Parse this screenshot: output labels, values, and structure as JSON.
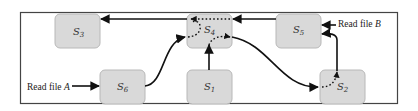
{
  "diagram": {
    "type": "state-transition",
    "frame": {
      "x": 20,
      "y": 12,
      "width": 378,
      "height": 92
    },
    "states": [
      {
        "id": "S3",
        "letter": "S",
        "sub": "3",
        "x": 55,
        "y": 14,
        "w": 45,
        "h": 34
      },
      {
        "id": "S4",
        "letter": "S",
        "sub": "4",
        "x": 187,
        "y": 14,
        "w": 45,
        "h": 34
      },
      {
        "id": "S5",
        "letter": "S",
        "sub": "5",
        "x": 276,
        "y": 14,
        "w": 45,
        "h": 34
      },
      {
        "id": "S6",
        "letter": "S",
        "sub": "6",
        "x": 100,
        "y": 70,
        "w": 45,
        "h": 34
      },
      {
        "id": "S1",
        "letter": "S",
        "sub": "1",
        "x": 187,
        "y": 70,
        "w": 45,
        "h": 34
      },
      {
        "id": "S2",
        "letter": "S",
        "sub": "2",
        "x": 320,
        "y": 70,
        "w": 45,
        "h": 34
      }
    ],
    "inputs": [
      {
        "id": "input-a",
        "text": "Read file ",
        "var": "A",
        "target": "S6"
      },
      {
        "id": "input-b",
        "text": "Read file ",
        "var": "B",
        "target": "S5"
      }
    ],
    "edges": [
      {
        "from": "input-a",
        "to": "S6",
        "style": "solid"
      },
      {
        "from": "S6",
        "to": "S4",
        "style": "solid-curve"
      },
      {
        "from": "S1",
        "to": "S4",
        "style": "solid"
      },
      {
        "from": "S4",
        "to": "S3",
        "style": "solid"
      },
      {
        "from": "S5",
        "to": "S4",
        "style": "solid"
      },
      {
        "from": "input-b",
        "to": "S5",
        "style": "solid"
      },
      {
        "from": "S4",
        "to": "S2",
        "style": "solid-curve"
      },
      {
        "from": "S2",
        "to": "S5",
        "style": "solid-curve"
      }
    ],
    "internal_paths": [
      {
        "state": "S4",
        "style": "dotted",
        "description": "S5 input routed across S4 to S3 output; S6 input looped to S3 output; S1 input routed to S2 output"
      },
      {
        "state": "S2",
        "style": "dotted",
        "description": "S4 input routed to S5 output"
      }
    ],
    "colors": {
      "box_fill": "#d9d9d9",
      "box_stroke": "#b8b8b8",
      "line": "#111111",
      "frame": "#444444"
    }
  }
}
